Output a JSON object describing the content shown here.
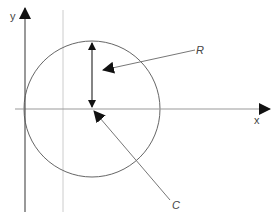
{
  "diagram": {
    "title": "",
    "axes": {
      "x_label": "x",
      "y_label": "y"
    },
    "labels": {
      "radius": "R",
      "center": "C"
    },
    "colors": {
      "axis": "#333333",
      "circle": "#666666",
      "guide_line": "#cccccc",
      "leader": "#777777",
      "arrowhead": "#111111",
      "text": "#444444"
    },
    "geometry": {
      "circle_center": [
        92,
        109
      ],
      "circle_radius": 68,
      "x_axis_y": 109,
      "y_axis_x": 25,
      "guide_line_x": 63
    }
  }
}
